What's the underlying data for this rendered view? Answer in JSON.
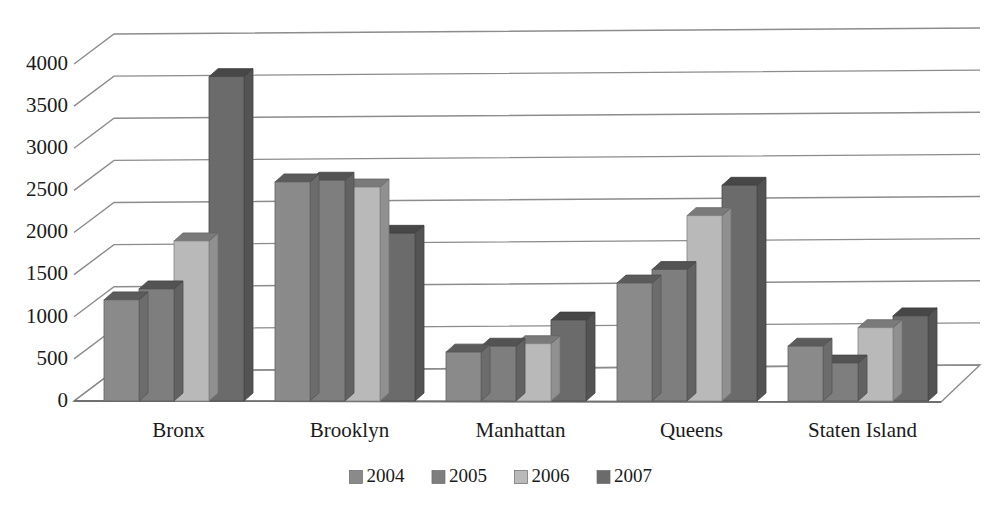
{
  "chart_data": {
    "type": "bar",
    "title": "",
    "subtitle": "",
    "xlabel": "",
    "ylabel": "",
    "categories": [
      "Bronx",
      "Brooklyn",
      "Manhattan",
      "Queens",
      "Staten Island"
    ],
    "series": [
      {
        "name": "2004",
        "color": "#8a8a8a",
        "values": [
          1200,
          2600,
          580,
          1400,
          650
        ]
      },
      {
        "name": "2005",
        "color": "#7e7e7e",
        "values": [
          1330,
          2620,
          650,
          1560,
          450
        ]
      },
      {
        "name": "2006",
        "color": "#b9b9b9",
        "values": [
          1900,
          2540,
          680,
          2200,
          870
        ]
      },
      {
        "name": "2007",
        "color": "#6b6b6b",
        "values": [
          3850,
          1990,
          960,
          2560,
          1010
        ]
      }
    ],
    "ylim": [
      0,
      4000
    ],
    "ytick_values": [
      0,
      500,
      1000,
      1500,
      2000,
      2500,
      3000,
      3500,
      4000
    ],
    "ytick_labels": [
      "0",
      "500",
      "1000",
      "1500",
      "2000",
      "2500",
      "3000",
      "3500",
      "4000"
    ],
    "grid": true,
    "legend_position": "bottom",
    "style": "3d-excel-grouped-bars",
    "background": "#ffffff"
  },
  "axis": {
    "y_labels": [
      "4000",
      "3500",
      "3000",
      "2500",
      "2000",
      "1500",
      "1000",
      "500",
      "0"
    ],
    "x_labels": [
      "Bronx",
      "Brooklyn",
      "Manhattan",
      "Queens",
      "Staten Island"
    ]
  },
  "legend": {
    "items": [
      {
        "label": "2004",
        "swatch": "#8a8a8a"
      },
      {
        "label": "2005",
        "swatch": "#7e7e7e"
      },
      {
        "label": "2006",
        "swatch": "#b9b9b9"
      },
      {
        "label": "2007",
        "swatch": "#6b6b6b"
      }
    ]
  }
}
